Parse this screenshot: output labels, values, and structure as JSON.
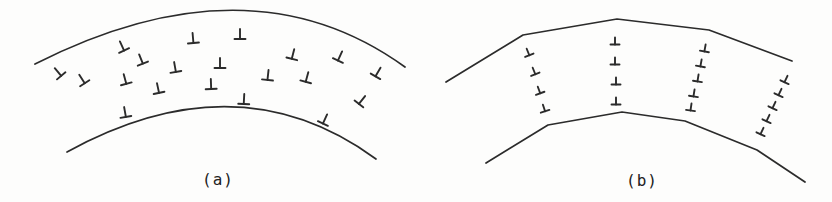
{
  "figure": {
    "caption_a": "(a)",
    "caption_b": "(b)",
    "ink_color": "#2b2b2b",
    "background_color": "#fdfdfc",
    "boundary_stroke_width": 1.7,
    "symbol_stroke_width": 1.9,
    "symbol_glyph": "⊥",
    "panels": [
      {
        "id": "a",
        "label": "(a)",
        "label_pos": {
          "x": 218,
          "y": 179
        },
        "symbol_size": {
          "stem": 10,
          "bar": 11
        },
        "boundaries": [
          {
            "name": "top-arc",
            "type": "quadratic",
            "from": [
              35,
              64
            ],
            "control": [
              250,
              -45
            ],
            "to": [
              405,
              67
            ]
          },
          {
            "name": "bottom-arc",
            "type": "quadratic",
            "from": [
              67,
              152
            ],
            "control": [
              238,
              58
            ],
            "to": [
              376,
              159
            ]
          }
        ],
        "dislocations": [
          {
            "x": 58,
            "y": 72,
            "rot": -40
          },
          {
            "x": 82,
            "y": 79,
            "rot": -33
          },
          {
            "x": 122,
            "y": 46,
            "rot": -25
          },
          {
            "x": 141,
            "y": 59,
            "rot": -22
          },
          {
            "x": 125,
            "y": 79,
            "rot": -15
          },
          {
            "x": 158,
            "y": 88,
            "rot": -12
          },
          {
            "x": 175,
            "y": 67,
            "rot": -10
          },
          {
            "x": 193,
            "y": 38,
            "rot": -5
          },
          {
            "x": 211,
            "y": 84,
            "rot": -2
          },
          {
            "x": 220,
            "y": 63,
            "rot": 0
          },
          {
            "x": 240,
            "y": 34,
            "rot": 0
          },
          {
            "x": 244,
            "y": 99,
            "rot": 3
          },
          {
            "x": 268,
            "y": 75,
            "rot": 6
          },
          {
            "x": 293,
            "y": 54,
            "rot": 14
          },
          {
            "x": 307,
            "y": 77,
            "rot": 15
          },
          {
            "x": 340,
            "y": 56,
            "rot": 25
          },
          {
            "x": 378,
            "y": 72,
            "rot": 30
          },
          {
            "x": 362,
            "y": 100,
            "rot": 38
          },
          {
            "x": 325,
            "y": 119,
            "rot": 25
          },
          {
            "x": 125,
            "y": 112,
            "rot": -10
          }
        ]
      },
      {
        "id": "b",
        "label": "(b)",
        "label_pos": {
          "x": 642,
          "y": 180
        },
        "symbol_size": {
          "stem": 7,
          "bar": 9
        },
        "boundaries": [
          {
            "name": "top-polyline",
            "type": "polyline",
            "points": [
              [
                446,
                82
              ],
              [
                523,
                35
              ],
              [
                617,
                19
              ],
              [
                709,
                30
              ],
              [
                792,
                61
              ]
            ]
          },
          {
            "name": "bottom-polyline",
            "type": "polyline",
            "points": [
              [
                486,
                163
              ],
              [
                548,
                125
              ],
              [
                622,
                112
              ],
              [
                685,
                121
              ],
              [
                757,
                150
              ],
              [
                805,
                182
              ]
            ]
          }
        ],
        "dislocation_walls": [
          {
            "name": "wall-1",
            "dislocations": [
              {
                "x": 528,
                "y": 52,
                "rot": -22
              },
              {
                "x": 534,
                "y": 71,
                "rot": -22
              },
              {
                "x": 539,
                "y": 90,
                "rot": -20
              },
              {
                "x": 544,
                "y": 108,
                "rot": -18
              }
            ]
          },
          {
            "name": "wall-2",
            "dislocations": [
              {
                "x": 615,
                "y": 41,
                "rot": 0
              },
              {
                "x": 615,
                "y": 61,
                "rot": 0
              },
              {
                "x": 616,
                "y": 81,
                "rot": 0
              },
              {
                "x": 616,
                "y": 101,
                "rot": 0
              }
            ]
          },
          {
            "name": "wall-3",
            "dislocations": [
              {
                "x": 705,
                "y": 48,
                "rot": 10
              },
              {
                "x": 701,
                "y": 63,
                "rot": 10
              },
              {
                "x": 698,
                "y": 78,
                "rot": 9
              },
              {
                "x": 694,
                "y": 93,
                "rot": 9
              },
              {
                "x": 691,
                "y": 107,
                "rot": 8
              }
            ]
          },
          {
            "name": "wall-4",
            "dislocations": [
              {
                "x": 786,
                "y": 79,
                "rot": 25
              },
              {
                "x": 780,
                "y": 92,
                "rot": 25
              },
              {
                "x": 774,
                "y": 105,
                "rot": 25
              },
              {
                "x": 768,
                "y": 118,
                "rot": 25
              },
              {
                "x": 762,
                "y": 131,
                "rot": 25
              }
            ]
          }
        ]
      }
    ]
  }
}
